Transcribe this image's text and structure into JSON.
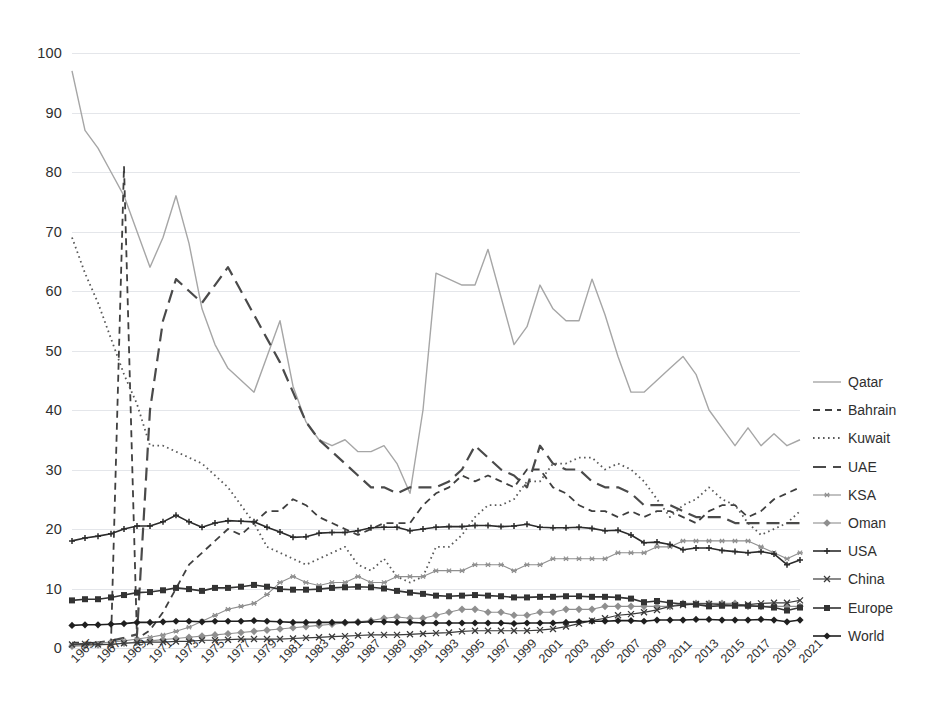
{
  "chart": {
    "title": "",
    "subtitle": "",
    "xlabel": "",
    "ylabel": ""
  },
  "axis": {
    "y_ticks": [
      "0",
      "10",
      "20",
      "30",
      "40",
      "50",
      "60",
      "70",
      "80",
      "90",
      "100"
    ],
    "x_ticks": [
      "1965",
      "1967",
      "1969",
      "1971",
      "1973",
      "1975",
      "1977",
      "1979",
      "1981",
      "1983",
      "1985",
      "1987",
      "1989",
      "1991",
      "1993",
      "1995",
      "1997",
      "1999",
      "2001",
      "2003",
      "2005",
      "2007",
      "2009",
      "2011",
      "2013",
      "2015",
      "2017",
      "2019",
      "2021"
    ]
  },
  "legend": {
    "position": "right",
    "items": [
      {
        "label": "Qatar",
        "key": "Qatar",
        "style": "solid",
        "marker": "none",
        "color": "#a6a6a6",
        "width": 1.4
      },
      {
        "label": "Bahrain",
        "key": "Bahrain",
        "style": "dashed",
        "marker": "none",
        "color": "#3f3f3f",
        "width": 1.8
      },
      {
        "label": "Kuwait",
        "key": "Kuwait",
        "style": "dotted",
        "marker": "none",
        "color": "#595959",
        "width": 1.8
      },
      {
        "label": "UAE",
        "key": "UAE",
        "style": "longdash",
        "marker": "none",
        "color": "#4a4a4a",
        "width": 2.2
      },
      {
        "label": "KSA",
        "key": "KSA",
        "style": "solid",
        "marker": "star",
        "color": "#8f8f8f",
        "width": 1.1
      },
      {
        "label": "Oman",
        "key": "Oman",
        "style": "solid",
        "marker": "diamond-open",
        "color": "#8f8f8f",
        "width": 1.1
      },
      {
        "label": "USA",
        "key": "USA",
        "style": "solid",
        "marker": "plus",
        "color": "#2b2b2b",
        "width": 1.6
      },
      {
        "label": "China",
        "key": "China",
        "style": "solid",
        "marker": "cross",
        "color": "#3a3a3a",
        "width": 1.2
      },
      {
        "label": "Europe",
        "key": "Europe",
        "style": "solid",
        "marker": "square",
        "color": "#333333",
        "width": 1.6
      },
      {
        "label": "World",
        "key": "World",
        "style": "solid",
        "marker": "diamond",
        "color": "#1f1f1f",
        "width": 1.6
      }
    ]
  },
  "chart_data": {
    "type": "line",
    "title": "",
    "xlabel": "",
    "ylabel": "",
    "ylim": [
      0,
      100
    ],
    "xlim": [
      "1965",
      "2021"
    ],
    "grid": true,
    "legend_position": "right",
    "x": [
      "1965",
      "1966",
      "1967",
      "1968",
      "1969",
      "1970",
      "1971",
      "1972",
      "1973",
      "1974",
      "1975",
      "1976",
      "1977",
      "1978",
      "1979",
      "1980",
      "1981",
      "1982",
      "1983",
      "1984",
      "1985",
      "1986",
      "1987",
      "1988",
      "1989",
      "1990",
      "1991",
      "1992",
      "1993",
      "1994",
      "1995",
      "1996",
      "1997",
      "1998",
      "1999",
      "2000",
      "2001",
      "2002",
      "2003",
      "2004",
      "2005",
      "2006",
      "2007",
      "2008",
      "2009",
      "2010",
      "2011",
      "2012",
      "2013",
      "2014",
      "2015",
      "2016",
      "2017",
      "2018",
      "2019",
      "2020",
      "2021"
    ],
    "series": [
      {
        "name": "Qatar",
        "values": [
          97,
          87,
          84,
          80,
          76,
          70,
          64,
          69,
          76,
          68,
          57,
          51,
          47,
          45,
          43,
          49,
          55,
          44,
          38,
          35,
          34,
          35,
          33,
          33,
          34,
          31,
          26,
          40,
          63,
          62,
          61,
          61,
          67,
          59,
          51,
          54,
          61,
          57,
          55,
          55,
          62,
          56,
          49,
          43,
          43,
          45,
          47,
          49,
          46,
          40,
          37,
          34,
          37,
          34,
          36,
          34,
          35
        ]
      },
      {
        "name": "Bahrain",
        "values": [
          0.9,
          0.9,
          0.9,
          0.9,
          81,
          1.5,
          3,
          6,
          10,
          14,
          16,
          18,
          20,
          19,
          21,
          23,
          23,
          25,
          24,
          22,
          21,
          20,
          19,
          20,
          21,
          21,
          21,
          24,
          26,
          27,
          29,
          28,
          29,
          28,
          27,
          30,
          30,
          27,
          26,
          24,
          23,
          23,
          22,
          23,
          22,
          23,
          23,
          22,
          21,
          23,
          24,
          24,
          22,
          23,
          25,
          26,
          27
        ]
      },
      {
        "name": "Kuwait",
        "values": [
          69,
          63,
          58,
          52,
          46,
          41,
          34,
          34,
          33,
          32,
          31,
          29,
          27,
          24,
          21,
          17,
          16,
          15,
          14,
          15,
          16,
          17,
          14,
          13,
          15,
          12,
          11,
          12,
          17,
          17,
          19,
          22,
          24,
          24,
          25,
          28,
          28,
          31,
          31,
          32,
          32,
          30,
          31,
          30,
          28,
          25,
          22,
          24,
          25,
          27,
          25,
          24,
          21,
          19,
          20,
          21,
          23
        ]
      },
      {
        "name": "UAE",
        "values": [
          0.5,
          0.7,
          0.9,
          1.2,
          1.7,
          2.3,
          40,
          55,
          62,
          60,
          58,
          61,
          64,
          60,
          56,
          52,
          48,
          43,
          38,
          35,
          33,
          31,
          29,
          27,
          27,
          26,
          27,
          27,
          27,
          28,
          30,
          34,
          32,
          30,
          29,
          27,
          34,
          31,
          30,
          30,
          28,
          27,
          27,
          26,
          24,
          24,
          24,
          23,
          22,
          22,
          22,
          21,
          21,
          21,
          21,
          21,
          21
        ]
      },
      {
        "name": "KSA",
        "values": [
          0.5,
          0.6,
          0.8,
          1,
          1.2,
          1.5,
          1.8,
          2.2,
          2.8,
          3.5,
          4.5,
          5.5,
          6.5,
          7,
          7.5,
          9,
          11,
          12,
          11,
          10.5,
          11,
          11,
          12,
          11,
          11,
          12,
          12,
          12,
          13,
          13,
          13,
          14,
          14,
          14,
          13,
          14,
          14,
          15,
          15,
          15,
          15,
          15,
          16,
          16,
          16,
          17,
          17,
          18,
          18,
          18,
          18,
          18,
          18,
          17,
          16,
          15,
          16
        ]
      },
      {
        "name": "Oman",
        "values": [
          0.3,
          0.4,
          0.5,
          0.6,
          0.8,
          1,
          1.2,
          1.4,
          1.6,
          1.8,
          2,
          2.2,
          2.4,
          2.6,
          2.8,
          3,
          3.2,
          3.4,
          3.6,
          3.8,
          4,
          4.2,
          4.4,
          4.6,
          5,
          5.2,
          5,
          5,
          5.5,
          6,
          6.5,
          6.5,
          6,
          6,
          5.5,
          5.5,
          6,
          6,
          6.5,
          6.5,
          6.5,
          7,
          7,
          7,
          7,
          7,
          7,
          7.5,
          7.5,
          7.5,
          7.5,
          7.5,
          7,
          7,
          7,
          7,
          7
        ]
      },
      {
        "name": "USA",
        "values": [
          18,
          18.5,
          18.8,
          19.2,
          20,
          20.5,
          20.5,
          21.2,
          22.3,
          21.2,
          20.3,
          21,
          21.4,
          21.3,
          21.2,
          20.3,
          19.5,
          18.6,
          18.7,
          19.3,
          19.4,
          19.4,
          19.7,
          20.2,
          20.3,
          20.3,
          19.7,
          20,
          20.3,
          20.4,
          20.4,
          20.6,
          20.6,
          20.4,
          20.5,
          20.8,
          20.3,
          20.2,
          20.2,
          20.3,
          20.1,
          19.7,
          19.8,
          19,
          17.7,
          17.8,
          17.4,
          16.5,
          16.8,
          16.8,
          16.4,
          16.2,
          16,
          16.2,
          15.8,
          14,
          14.8
        ]
      },
      {
        "name": "China",
        "values": [
          0.6,
          0.7,
          0.6,
          0.6,
          0.8,
          0.9,
          1,
          1,
          1.1,
          1.1,
          1.3,
          1.3,
          1.4,
          1.5,
          1.5,
          1.5,
          1.5,
          1.6,
          1.7,
          1.8,
          1.9,
          2,
          2.1,
          2.2,
          2.2,
          2.2,
          2.3,
          2.4,
          2.5,
          2.6,
          2.8,
          2.9,
          2.9,
          2.9,
          2.9,
          2.9,
          3,
          3.2,
          3.6,
          4.1,
          4.6,
          5,
          5.5,
          5.7,
          6,
          6.4,
          7,
          7.2,
          7.4,
          7.4,
          7.3,
          7.2,
          7.3,
          7.5,
          7.6,
          7.6,
          8
        ]
      },
      {
        "name": "Europe",
        "values": [
          8,
          8.2,
          8.2,
          8.5,
          8.9,
          9.3,
          9.4,
          9.7,
          10.1,
          9.9,
          9.6,
          10.1,
          10.1,
          10.3,
          10.6,
          10.3,
          9.9,
          9.8,
          9.8,
          9.9,
          10.1,
          10.2,
          10.3,
          10.2,
          10,
          9.6,
          9.3,
          9.1,
          8.8,
          8.7,
          8.8,
          8.9,
          8.8,
          8.7,
          8.5,
          8.5,
          8.6,
          8.6,
          8.7,
          8.7,
          8.6,
          8.6,
          8.5,
          8.3,
          7.7,
          7.9,
          7.6,
          7.4,
          7.3,
          7,
          7.1,
          7.1,
          7.1,
          7,
          6.8,
          6.3,
          6.8
        ]
      },
      {
        "name": "World",
        "values": [
          3.8,
          3.9,
          3.9,
          4,
          4.1,
          4.3,
          4.3,
          4.4,
          4.5,
          4.5,
          4.4,
          4.5,
          4.5,
          4.5,
          4.6,
          4.5,
          4.4,
          4.3,
          4.3,
          4.3,
          4.3,
          4.3,
          4.3,
          4.4,
          4.4,
          4.3,
          4.3,
          4.2,
          4.2,
          4.2,
          4.2,
          4.2,
          4.2,
          4.2,
          4.1,
          4.2,
          4.2,
          4.2,
          4.3,
          4.4,
          4.5,
          4.5,
          4.6,
          4.6,
          4.5,
          4.7,
          4.7,
          4.7,
          4.8,
          4.8,
          4.7,
          4.7,
          4.7,
          4.8,
          4.7,
          4.4,
          4.7
        ]
      }
    ]
  }
}
